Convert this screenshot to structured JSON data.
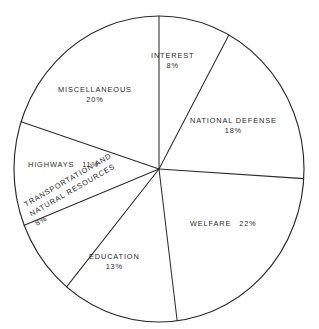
{
  "chart_data": {
    "type": "pie",
    "title": "",
    "xlabel": "",
    "ylabel": "",
    "unit": "%",
    "start_angle_deg": 0,
    "direction": "clockwise",
    "categories": [
      "INTEREST",
      "NATIONAL DEFENSE",
      "WELFARE",
      "EDUCATION",
      "TRANSPORTATION AND NATURAL RESOURCES",
      "HIGHWAYS",
      "MISCELLANEOUS"
    ],
    "values": [
      8,
      18,
      22,
      13,
      8,
      11,
      20
    ],
    "slices": [
      {
        "name": "INTEREST",
        "value": 8,
        "pct_label": "8%",
        "start_deg": 0,
        "sweep_deg": 28.8
      },
      {
        "name": "NATIONAL DEFENSE",
        "value": 18,
        "pct_label": "18%",
        "start_deg": 28.8,
        "sweep_deg": 64.8
      },
      {
        "name": "WELFARE",
        "value": 22,
        "pct_label": "22%",
        "start_deg": 93.6,
        "sweep_deg": 79.2
      },
      {
        "name": "EDUCATION",
        "value": 13,
        "pct_label": "13%",
        "start_deg": 172.8,
        "sweep_deg": 46.8
      },
      {
        "name": "TRANSPORTATION AND NATURAL RESOURCES",
        "value": 8,
        "pct_label": "8%",
        "start_deg": 219.6,
        "sweep_deg": 28.8
      },
      {
        "name": "HIGHWAYS",
        "value": 11,
        "pct_label": "11%",
        "start_deg": 248.4,
        "sweep_deg": 39.6
      },
      {
        "name": "MISCELLANEOUS",
        "value": 20,
        "pct_label": "20%",
        "start_deg": 288.0,
        "sweep_deg": 72.0
      }
    ],
    "legend": "none",
    "grid": false,
    "colors": {
      "outline": "#2b2b2b",
      "background": "#ffffff",
      "text": "#2b2b2b"
    }
  },
  "labels": {
    "interest": {
      "name": "INTEREST",
      "pct": "8%"
    },
    "national": {
      "name": "NATIONAL DEFENSE",
      "pct": "18%"
    },
    "welfare": {
      "name": "WELFARE",
      "pct": "22%"
    },
    "education": {
      "name": "EDUCATION",
      "pct": "13%"
    },
    "transportation": {
      "line1": "TRANSPORTATION AND",
      "line2": "NATURAL RESOURCES",
      "pct": "8%"
    },
    "highways": {
      "name": "HIGHWAYS",
      "pct": "11%"
    },
    "miscellaneous": {
      "name": "MISCELLANEOUS",
      "pct": "20%"
    }
  },
  "header": {
    "title": ""
  }
}
